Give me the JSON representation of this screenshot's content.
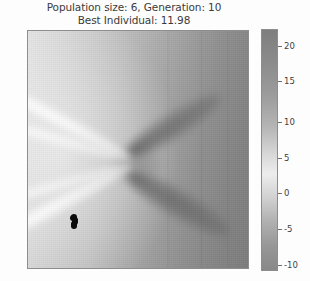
{
  "figure": {
    "title_line_1": "Population size: 6, Generation: 10",
    "title_line_2": "Best Individual: 11.98",
    "background_color": "#fdfdfd",
    "title_color": "#3b3b3b",
    "axes_edge_color": "#8d8d8d",
    "marker_color": "#0b0b0b"
  },
  "chart_data": {
    "type": "heatmap",
    "title": "Population size: 6, Generation: 10\nBest Individual: 11.98",
    "xlabel": "",
    "ylabel": "",
    "colormap": "gray",
    "grid": false,
    "legend": null,
    "colorbar": {
      "orientation": "vertical",
      "position": "right",
      "vmin": -12,
      "vmax": 23,
      "ticks": [
        20,
        15,
        10,
        5,
        0,
        -5,
        -10
      ],
      "tick_labels": [
        "20",
        "15",
        "10",
        "5",
        "0",
        "-5",
        "-10"
      ]
    },
    "annotations": {
      "population_size": 6,
      "generation": 10,
      "best_individual": 11.98
    },
    "markers": {
      "name": "population-individuals",
      "count": 6,
      "color": "#0b0b0b",
      "points_axes_fraction": [
        [
          0.2,
          0.785
        ],
        [
          0.203,
          0.8
        ],
        [
          0.198,
          0.812
        ],
        [
          0.205,
          0.793
        ],
        [
          0.201,
          0.805
        ],
        [
          0.199,
          0.779
        ]
      ]
    },
    "field_description": "Grayscale scalar fitness landscape with a saddle/branch singularity near the center; bright high-value ridges fan out toward the left, dark low-value lobes radiate toward the right."
  },
  "colorbar_ticks": [
    {
      "label": "20",
      "top_px": 17
    },
    {
      "label": "15",
      "top_px": 52
    },
    {
      "label": "10",
      "top_px": 93
    },
    {
      "label": "5",
      "top_px": 129
    },
    {
      "label": "0",
      "top_px": 164
    },
    {
      "label": "-5",
      "top_px": 200
    },
    {
      "label": "-10",
      "top_px": 236
    }
  ],
  "markers_px": [
    {
      "left": 42.0,
      "top": 184.0
    },
    {
      "left": 43.5,
      "top": 188.0
    },
    {
      "left": 42.5,
      "top": 191.5
    },
    {
      "left": 44.0,
      "top": 186.0
    },
    {
      "left": 43.0,
      "top": 190.0
    },
    {
      "left": 42.8,
      "top": 182.5
    }
  ]
}
